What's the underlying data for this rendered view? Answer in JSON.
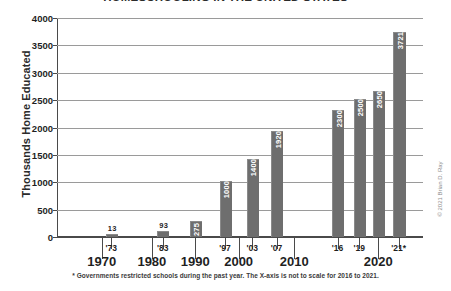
{
  "chart_data": {
    "type": "bar",
    "title": "HOMESCHOOLING IN THE UNITED STATES",
    "xlabel": "",
    "ylabel": "Thousands Home Educated",
    "ylim": [
      0,
      4000
    ],
    "ytick_values": [
      4000,
      3500,
      3000,
      2500,
      2000,
      1500,
      1000,
      500,
      0
    ],
    "ytick_labels": [
      "4000",
      "3500",
      "3000",
      "2500",
      "2000",
      "1500",
      "1000",
      "500",
      "0"
    ],
    "grid": true,
    "legend": "none",
    "categories": [
      "'73",
      "'83",
      "1990",
      "'97",
      "'03",
      "'07",
      "'16",
      "'19",
      "'21",
      "'21*"
    ],
    "values": [
      13,
      93,
      275,
      1000,
      1400,
      1920,
      2300,
      2500,
      2650,
      3721
    ],
    "value_labels": [
      "13",
      "93",
      "275",
      "1000",
      "1400",
      "1920",
      "2300",
      "2500",
      "2650",
      "3721"
    ],
    "bars": [
      {
        "label": "'73",
        "value": 13,
        "value_label": "13",
        "x_px": 72,
        "width_px": 16,
        "label_inside": false
      },
      {
        "label": "'83",
        "value": 93,
        "value_label": "93",
        "x_px": 148,
        "width_px": 16,
        "label_inside": false
      },
      {
        "label": "1990",
        "value": 275,
        "value_label": "275",
        "x_px": 196,
        "width_px": 16,
        "label_inside": true
      },
      {
        "label": "'97",
        "value": 1000,
        "value_label": "1000",
        "x_px": 240,
        "width_px": 16,
        "label_inside": true
      },
      {
        "label": "'03",
        "value": 1400,
        "value_label": "1400",
        "x_px": 280,
        "width_px": 16,
        "label_inside": true
      },
      {
        "label": "'07",
        "value": 1920,
        "value_label": "1920",
        "x_px": 316,
        "width_px": 16,
        "label_inside": true
      },
      {
        "label": "'16",
        "value": 2300,
        "value_label": "2300",
        "x_px": 406,
        "width_px": 16,
        "label_inside": true
      },
      {
        "label": "'19",
        "value": 2500,
        "value_label": "2500",
        "x_px": 438,
        "width_px": 16,
        "label_inside": true
      },
      {
        "label": "'20",
        "value": 2650,
        "value_label": "2650",
        "x_px": 466,
        "width_px": 16,
        "label_inside": true
      },
      {
        "label": "'21*",
        "value": 3721,
        "value_label": "3721",
        "x_px": 496,
        "width_px": 18,
        "label_inside": true
      }
    ],
    "x_year_ticks": [
      {
        "label": "'73",
        "x_px": 80
      },
      {
        "label": "'83",
        "x_px": 156
      },
      {
        "label": "'97",
        "x_px": 248
      },
      {
        "label": "'03",
        "x_px": 288
      },
      {
        "label": "'07",
        "x_px": 324
      },
      {
        "label": "'16",
        "x_px": 414
      },
      {
        "label": "'19",
        "x_px": 446
      },
      {
        "label": "'21*",
        "x_px": 504
      }
    ],
    "x_decade_ticks": [
      {
        "label": "1970",
        "x_px": 66
      },
      {
        "label": "1980",
        "x_px": 140
      },
      {
        "label": "1990",
        "x_px": 204
      },
      {
        "label": "2000",
        "x_px": 268
      },
      {
        "label": "2010",
        "x_px": 350
      },
      {
        "label": "2020",
        "x_px": 474
      }
    ],
    "annotations": {
      "footnote": "* Governments restricted schools during the past year. The X-axis is not to scale for 2016 to 2021.",
      "copyright": "© 2021 Brian D. Ray"
    },
    "colors": {
      "bar_fill": "#6e6e6e",
      "grid": "#9a9a9a",
      "axis": "#4a4a4a",
      "text": "#1f1f1f",
      "value_label_inside": "#ffffff",
      "background": "#ffffff"
    }
  }
}
